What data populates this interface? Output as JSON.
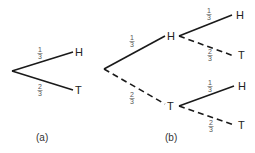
{
  "diagram": {
    "type": "probability-tree",
    "line_color": "#1a1a1a",
    "trees": [
      {
        "caption": "(a)",
        "branches": [
          {
            "outcome": "H",
            "probability": {
              "num": "1",
              "den": "3"
            },
            "style": "solid"
          },
          {
            "outcome": "T",
            "probability": {
              "num": "2",
              "den": "3"
            },
            "style": "solid"
          }
        ]
      },
      {
        "caption": "(b)",
        "branches": [
          {
            "outcome": "H",
            "probability": {
              "num": "1",
              "den": "3"
            },
            "style": "solid",
            "children": [
              {
                "outcome": "H",
                "probability": {
                  "num": "1",
                  "den": "3"
                },
                "style": "solid"
              },
              {
                "outcome": "T",
                "probability": {
                  "num": "2",
                  "den": "3"
                },
                "style": "dashed"
              }
            ]
          },
          {
            "outcome": "T",
            "probability": {
              "num": "2",
              "den": "3"
            },
            "style": "dashed",
            "children": [
              {
                "outcome": "H",
                "probability": {
                  "num": "1",
                  "den": "3"
                },
                "style": "solid"
              },
              {
                "outcome": "T",
                "probability": {
                  "num": "2",
                  "den": "3"
                },
                "style": "dashed"
              }
            ]
          }
        ]
      }
    ]
  }
}
